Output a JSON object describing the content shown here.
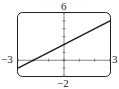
{
  "chart_data": {
    "type": "line",
    "title": "",
    "xlabel": "",
    "ylabel": "",
    "xlim": [
      -3,
      3
    ],
    "ylim": [
      -2,
      6
    ],
    "x_tick_step": 1,
    "y_tick_step": 1,
    "grid": false,
    "series": [
      {
        "name": "y = x + 2",
        "x": [
          -3,
          3
        ],
        "y": [
          -1,
          5
        ]
      }
    ],
    "window_labels": {
      "xmin": "−3",
      "xmax": "3",
      "ymin": "−2",
      "ymax": "6"
    }
  },
  "colors": {
    "line": "#231f20",
    "frame": "#231f20"
  }
}
